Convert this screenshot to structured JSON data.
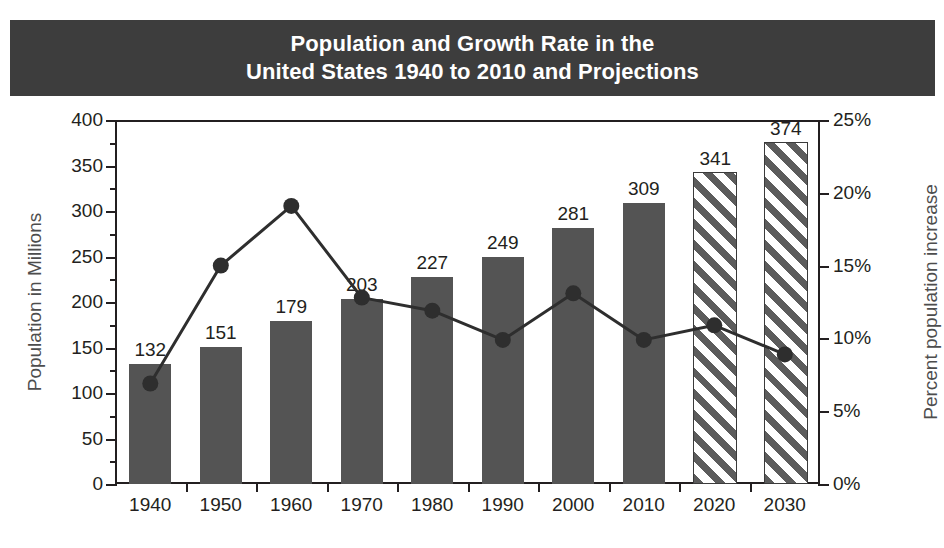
{
  "title": {
    "line1": "Population and Growth Rate in the",
    "line2": "United States 1940 to 2010 and Projections"
  },
  "chart_data": {
    "type": "bar",
    "title": "Population and Growth Rate in the United States 1940 to 2010 and Projections",
    "xlabel": "",
    "ylabel": "Population in Millions",
    "y2label": "Percent population increase",
    "categories": [
      "1940",
      "1950",
      "1960",
      "1970",
      "1980",
      "1990",
      "2000",
      "2010",
      "2020",
      "2030"
    ],
    "ylim": [
      0,
      400
    ],
    "y2lim": [
      0,
      25
    ],
    "yticks": [
      0,
      50,
      100,
      150,
      200,
      250,
      300,
      350,
      400
    ],
    "yticklabels": [
      "0",
      "50",
      "100",
      "150",
      "200",
      "250",
      "300",
      "350",
      "400"
    ],
    "y2ticks": [
      0,
      5,
      10,
      15,
      20,
      25
    ],
    "y2ticklabels": [
      "0%",
      "5%",
      "10%",
      "15%",
      "20%",
      "25%"
    ],
    "grid": false,
    "legend": "none",
    "series": [
      {
        "name": "Population in Millions",
        "type": "bar",
        "values": [
          132,
          151,
          179,
          203,
          227,
          249,
          281,
          309,
          341,
          374
        ],
        "data_labels": [
          "132",
          "151",
          "179",
          "203",
          "227",
          "249",
          "281",
          "309",
          "341",
          "374"
        ],
        "projected_from": "2020",
        "styles": [
          "solid",
          "solid",
          "solid",
          "solid",
          "solid",
          "solid",
          "solid",
          "solid",
          "hatched",
          "hatched"
        ]
      },
      {
        "name": "Percent population increase",
        "type": "line",
        "axis": "secondary",
        "values": [
          6.9,
          15.0,
          19.1,
          12.8,
          11.9,
          9.9,
          13.1,
          9.9,
          10.9,
          8.9
        ]
      }
    ]
  },
  "colors": {
    "banner_background": "#3d3d3d",
    "banner_text": "#ffffff",
    "bar_fill": "#545454",
    "bar_hatch": "#5c5c5c",
    "line": "#2e2e2e",
    "axis": "#231f20",
    "axis_title": "#4d4d4d"
  }
}
